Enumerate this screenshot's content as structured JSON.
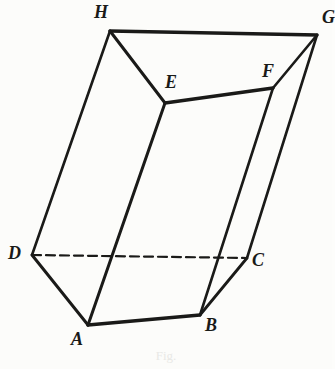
{
  "figure": {
    "caption": "Fig.",
    "background_color": "#fcfcfa",
    "ink_color": "#1a1a18",
    "canvas": {
      "width": 332,
      "height": 369
    },
    "vertices": [
      {
        "id": "A",
        "label": "A",
        "x": 88,
        "y": 325,
        "label_x": 71,
        "label_y": 330
      },
      {
        "id": "B",
        "label": "B",
        "x": 200,
        "y": 315,
        "label_x": 205,
        "label_y": 316
      },
      {
        "id": "C",
        "label": "C",
        "x": 247,
        "y": 258,
        "label_x": 252,
        "label_y": 251
      },
      {
        "id": "D",
        "label": "D",
        "x": 32,
        "y": 255,
        "label_x": 8,
        "label_y": 244
      },
      {
        "id": "E",
        "label": "E",
        "x": 165,
        "y": 103,
        "label_x": 165,
        "label_y": 73
      },
      {
        "id": "F",
        "label": "F",
        "x": 273,
        "y": 88,
        "label_x": 262,
        "label_y": 62
      },
      {
        "id": "G",
        "label": "G",
        "x": 317,
        "y": 35,
        "label_x": 322,
        "label_y": 8
      },
      {
        "id": "H",
        "label": "H",
        "x": 110,
        "y": 31,
        "label_x": 94,
        "label_y": 3
      }
    ],
    "edges": [
      {
        "id": "HG",
        "from": "H",
        "to": "G",
        "style": "solid",
        "width": 3.4,
        "visible": true
      },
      {
        "id": "HE",
        "from": "H",
        "to": "E",
        "style": "solid",
        "width": 3.0,
        "visible": true
      },
      {
        "id": "EF",
        "from": "E",
        "to": "F",
        "style": "solid",
        "width": 3.4,
        "visible": true
      },
      {
        "id": "FG",
        "from": "F",
        "to": "G",
        "style": "solid",
        "width": 2.6,
        "visible": true
      },
      {
        "id": "HD",
        "from": "H",
        "to": "D",
        "style": "solid",
        "width": 2.6,
        "visible": true
      },
      {
        "id": "EA",
        "from": "E",
        "to": "A",
        "style": "solid",
        "width": 3.0,
        "visible": true
      },
      {
        "id": "FB",
        "from": "F",
        "to": "B",
        "style": "solid",
        "width": 2.6,
        "visible": true
      },
      {
        "id": "GC",
        "from": "G",
        "to": "C",
        "style": "solid",
        "width": 2.6,
        "visible": true
      },
      {
        "id": "DA",
        "from": "D",
        "to": "A",
        "style": "solid",
        "width": 3.0,
        "visible": true
      },
      {
        "id": "AB",
        "from": "A",
        "to": "B",
        "style": "solid",
        "width": 3.4,
        "visible": true
      },
      {
        "id": "BC",
        "from": "B",
        "to": "C",
        "style": "solid",
        "width": 2.8,
        "visible": true
      },
      {
        "id": "DC",
        "from": "D",
        "to": "C",
        "style": "dashed",
        "width": 2.2,
        "visible": false
      }
    ],
    "dash_pattern": "9 5"
  }
}
